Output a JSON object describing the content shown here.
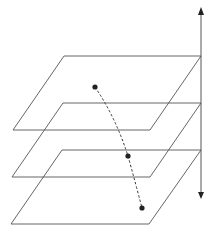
{
  "diagram": {
    "colors": {
      "background": "#ffffff",
      "plane_stroke": "#555555",
      "axis_stroke": "#555555",
      "dot_fill": "#222222",
      "trajectory_stroke": "#333333"
    },
    "planes": [
      {
        "name": "top-plane",
        "points": "64,56 201,56 150,130 13,130"
      },
      {
        "name": "middle-plane",
        "points": "63,103 201,103 150,177 12,177"
      },
      {
        "name": "bottom-plane",
        "points": "62,150 201,150 149,224 11,224"
      }
    ],
    "axis": {
      "x": 201,
      "y_top": 8,
      "y_bottom": 199
    },
    "points": [
      {
        "name": "point-top",
        "cx": 95,
        "cy": 87
      },
      {
        "name": "point-middle",
        "cx": 128,
        "cy": 156
      },
      {
        "name": "point-bottom",
        "cx": 142,
        "cy": 208
      }
    ],
    "trajectory_path": "M95,87 Q116,118 128,156 Q136,185 142,208"
  }
}
